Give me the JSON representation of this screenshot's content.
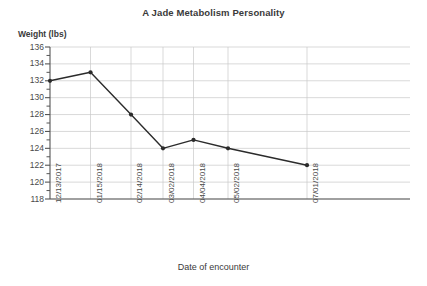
{
  "chart_data": {
    "type": "line",
    "title": "A Jade Metabolism Personality",
    "xlabel": "Date of encounter",
    "ylabel": "Weight (lbs)",
    "categories": [
      "12/13/2017",
      "01/15/2018",
      "02/14/2018",
      "03/02/2018",
      "04/04/2018",
      "05/02/2018",
      "07/01/2018"
    ],
    "values": [
      132,
      133,
      128,
      124,
      125,
      124,
      122
    ],
    "series": [
      {
        "name": "Weight",
        "values": [
          132,
          133,
          128,
          124,
          125,
          124,
          122
        ],
        "color": "#2b2b2b",
        "marker": "circle"
      }
    ],
    "points": [
      {
        "x": "12/13/2017",
        "y": 132
      },
      {
        "x": "01/15/2018",
        "y": 133
      },
      {
        "x": "02/14/2018",
        "y": 128
      },
      {
        "x": "03/02/2018",
        "y": 124
      },
      {
        "x": "04/04/2018",
        "y": 125
      },
      {
        "x": "05/02/2018",
        "y": 124
      },
      {
        "x": "07/01/2018",
        "y": 122
      }
    ],
    "ylim": [
      118,
      136
    ],
    "ytick_labels": [
      "136",
      "134",
      "132",
      "130",
      "128",
      "126",
      "124",
      "122",
      "120",
      "118"
    ],
    "ytick_values": [
      136,
      134,
      132,
      130,
      128,
      126,
      124,
      122,
      120,
      118
    ],
    "y_minor_ticks": [
      135,
      133,
      131,
      129,
      127,
      125,
      123,
      121,
      119
    ],
    "grid": {
      "horizontal": true,
      "vertical": true,
      "color": "#c8c8c8"
    },
    "legend": null,
    "axis_color": "#555555",
    "background": "#ffffff"
  },
  "labels": {
    "y_ticks": [
      "136",
      "134",
      "132",
      "130",
      "128",
      "126",
      "124",
      "122",
      "120",
      "118"
    ],
    "x_ticks": [
      "12/13/2017",
      "01/15/2018",
      "02/14/2018",
      "03/02/2018",
      "04/04/2018",
      "05/02/2018",
      "07/01/2018"
    ]
  }
}
